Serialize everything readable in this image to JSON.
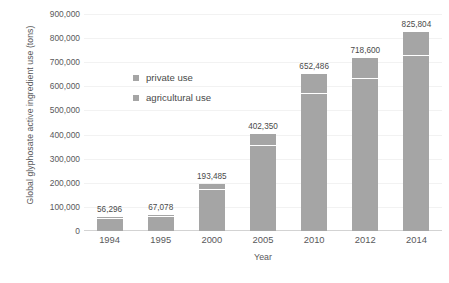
{
  "chart_data": {
    "type": "bar",
    "subtype": "stacked-bar",
    "title": "",
    "xlabel": "Year",
    "ylabel": "Global glyphosate active ingredient use (tons)",
    "categories": [
      "1994",
      "1995",
      "2000",
      "2005",
      "2010",
      "2012",
      "2014"
    ],
    "series": [
      {
        "name": "agricultural use",
        "color": "#a5a5a5",
        "values": [
          49700,
          58400,
          169000,
          352000,
          570000,
          632000,
          726000
        ]
      },
      {
        "name": "private use",
        "color": "#a5a5a5",
        "values": [
          6596,
          8678,
          24485,
          50350,
          82486,
          86600,
          99804
        ]
      }
    ],
    "totals": [
      56296,
      67078,
      193485,
      402350,
      652486,
      718600,
      825804
    ],
    "data_labels": [
      "56,296",
      "67,078",
      "193,485",
      "402,350",
      "652,486",
      "718,600",
      "825,804"
    ],
    "ylim": [
      0,
      900000
    ],
    "ytick_values": [
      0,
      100000,
      200000,
      300000,
      400000,
      500000,
      600000,
      700000,
      800000,
      900000
    ],
    "ytick_labels": [
      "0",
      "100,000",
      "200,000",
      "300,000",
      "400,000",
      "500,000",
      "600,000",
      "700,000",
      "800,000",
      "900,000"
    ],
    "grid": true,
    "grid_color": "#f2f2f2",
    "legend_position": "inside-upper-left",
    "legend": [
      "private use",
      "agricultural use"
    ],
    "background_color": "#ffffff"
  },
  "axes": {
    "y_title": "Global glyphosate active ingredient use (tons)",
    "x_title": "Year"
  },
  "legend": {
    "items": [
      {
        "label": "private use",
        "color": "#a5a5a5"
      },
      {
        "label": "agricultural use",
        "color": "#a5a5a5"
      }
    ]
  }
}
